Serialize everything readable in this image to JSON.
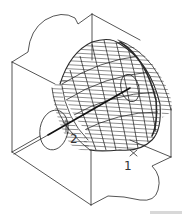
{
  "figure": {
    "type": "isometric cutaway diagram",
    "labels": {
      "point_1": "1",
      "point_2": "2"
    },
    "colors": {
      "line": "#2a2a2a",
      "background": "#ffffff"
    }
  }
}
